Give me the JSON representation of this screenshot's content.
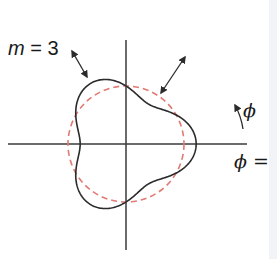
{
  "diagram": {
    "mode_label": {
      "variable": "m",
      "equals": " = ",
      "value": "3"
    },
    "angle_label": "ϕ",
    "angle_origin_label": {
      "variable": "ϕ",
      "suffix": " ="
    },
    "colors": {
      "axes": "#3a3a3a",
      "perturbed_curve": "#2b2b2b",
      "reference_circle": "#e07a72",
      "arrows": "#2b2b2b",
      "background": "#ffffff"
    },
    "geometry": {
      "center": [
        126,
        144
      ],
      "reference_radius": 58,
      "perturbation_amplitude": 0.21,
      "mode_number": 3,
      "x_axis": [
        8,
        247
      ],
      "y_axis": [
        40,
        250
      ]
    },
    "elements": [
      "horizontal axis",
      "vertical axis",
      "dashed circle (unperturbed)",
      "solid three-lobed curve (m = 3 perturbation)",
      "double-headed arrow upper-left",
      "double-headed arrow upper-right",
      "curved arrow indicating direction of ϕ"
    ]
  }
}
